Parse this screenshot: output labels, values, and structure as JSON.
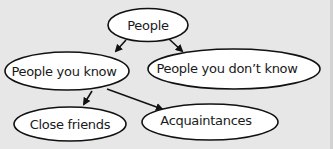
{
  "diagram": {
    "type": "hierarchy",
    "nodes": [
      {
        "id": "people",
        "label": "People",
        "cx": 148,
        "cy": 25,
        "rx": 40,
        "ry": 17
      },
      {
        "id": "people-you-know",
        "label": "People you know",
        "cx": 67,
        "cy": 71,
        "rx": 63,
        "ry": 19
      },
      {
        "id": "people-you-dont-know",
        "label": "People you don’t know",
        "cx": 234,
        "cy": 69,
        "rx": 87,
        "ry": 20
      },
      {
        "id": "close-friends",
        "label": "Close friends",
        "cx": 70,
        "cy": 124,
        "rx": 56,
        "ry": 17
      },
      {
        "id": "acquaintances",
        "label": "Acquaintances",
        "cx": 210,
        "cy": 122,
        "rx": 68,
        "ry": 18
      }
    ],
    "edges": [
      {
        "from": "people",
        "to": "people-you-know"
      },
      {
        "from": "people",
        "to": "people-you-dont-know"
      },
      {
        "from": "people-you-know",
        "to": "close-friends"
      },
      {
        "from": "people-you-know",
        "to": "acquaintances"
      }
    ],
    "colors": {
      "background": "#e7e7e7",
      "node_fill": "#ffffff",
      "stroke": "#111111"
    }
  }
}
